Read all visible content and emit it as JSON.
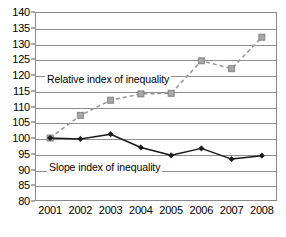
{
  "chart_data": {
    "type": "line",
    "title": "",
    "xlabel": "",
    "ylabel": "",
    "x": [
      "2001",
      "2002",
      "2003",
      "2004",
      "2005",
      "2006",
      "2007",
      "2008"
    ],
    "categories": [
      "2001",
      "2002",
      "2003",
      "2004",
      "2005",
      "2006",
      "2007",
      "2008"
    ],
    "ylim": [
      80,
      140
    ],
    "xlim": [
      "2001",
      "2008"
    ],
    "yticks": [
      80,
      85,
      90,
      95,
      100,
      105,
      110,
      115,
      120,
      125,
      130,
      135,
      140
    ],
    "grid": "horizontal",
    "legend_position": "inline-annotations",
    "series": [
      {
        "name": "Relative index of inequality",
        "values": [
          100,
          107.2,
          112,
          114,
          114.2,
          124.5,
          122,
          132
        ],
        "color": "#9a9a9a",
        "line_style": "dashed",
        "marker": "square"
      },
      {
        "name": "Slope index of inequality",
        "values": [
          100,
          99.7,
          101.2,
          97,
          94.5,
          96.7,
          93.3,
          94.4
        ],
        "color": "#1a1a1a",
        "line_style": "solid",
        "marker": "diamond"
      }
    ],
    "annotations": [
      {
        "text": "Relative index of inequality"
      },
      {
        "text": "Slope index of inequality"
      }
    ]
  },
  "axis": {
    "y_tick_labels": [
      "140",
      "135",
      "130",
      "125",
      "120",
      "115",
      "110",
      "105",
      "100",
      "95",
      "90",
      "85",
      "80"
    ],
    "x_tick_labels": [
      "2001",
      "2002",
      "2003",
      "2004",
      "2005",
      "2006",
      "2007",
      "2008"
    ]
  },
  "labels": {
    "relative": "Relative index of inequality",
    "slope": "Slope index of inequality"
  }
}
